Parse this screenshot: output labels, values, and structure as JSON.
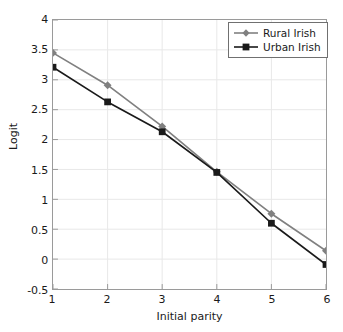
{
  "chart_data": {
    "type": "line",
    "title": "",
    "xlabel": "Initial parity",
    "ylabel": "Logit",
    "x": [
      1,
      2,
      3,
      4,
      5,
      6
    ],
    "categories": [
      "1",
      "2",
      "3",
      "4",
      "5",
      "6"
    ],
    "xlim": [
      1,
      6
    ],
    "ylim": [
      -0.5,
      4
    ],
    "yticks": [
      "4",
      "3.5",
      "3",
      "2.5",
      "2",
      "1.5",
      "1",
      "0.5",
      "0",
      "-0.5"
    ],
    "ytick_values": [
      4,
      3.5,
      3,
      2.5,
      2,
      1.5,
      1,
      0.5,
      0,
      -0.5
    ],
    "xticks": [
      "1",
      "2",
      "3",
      "4",
      "5",
      "6"
    ],
    "grid": true,
    "legend_position": "top-right",
    "series": [
      {
        "name": "Rural Irish",
        "values": [
          3.45,
          2.91,
          2.22,
          1.46,
          0.76,
          0.14
        ],
        "color": "#808080",
        "marker": "diamond"
      },
      {
        "name": "Urban Irish",
        "values": [
          3.21,
          2.63,
          2.13,
          1.45,
          0.6,
          -0.09
        ],
        "color": "#1a1a1a",
        "marker": "square"
      }
    ]
  },
  "legend": {
    "items": [
      {
        "label": "Rural Irish"
      },
      {
        "label": "Urban Irish"
      }
    ]
  },
  "colors": {
    "grid": "#e8e8e8",
    "frame": "#9a9a9a",
    "rural": "#808080",
    "urban": "#1a1a1a"
  }
}
